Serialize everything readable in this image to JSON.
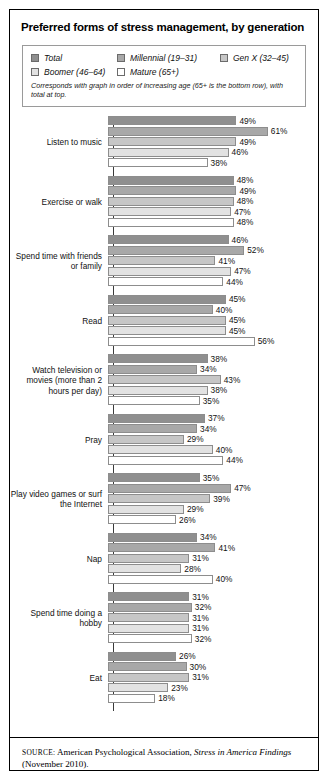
{
  "title": "Preferred forms of stress management, by generation",
  "legend": {
    "items": [
      {
        "label": "Total",
        "color": "#8f8f8f"
      },
      {
        "label": "Millennial (19–31)",
        "color": "#a8a8a8"
      },
      {
        "label": "Gen X (32–45)",
        "color": "#c6c6c6"
      },
      {
        "label": "Boomer (46–64)",
        "color": "#e2e2e2"
      },
      {
        "label": "Mature (65+)",
        "color": "#ffffff"
      }
    ],
    "note": "Corresponds with graph in order of increasing age (65+ is the bottom row), with total at top."
  },
  "source": {
    "label": "SOURCE:",
    "text_before": " American Psychological Association, ",
    "italic": "Stress in America Findings",
    "text_after": " (November 2010)."
  },
  "chart_data": {
    "type": "bar",
    "orientation": "horizontal",
    "title": "Preferred forms of stress management, by generation",
    "xlabel": "",
    "ylabel": "",
    "xlim": [
      0,
      61
    ],
    "grid": false,
    "value_suffix": "%",
    "legend_position": "top",
    "categories": [
      "Listen to music",
      "Exercise or walk",
      "Spend time with friends or family",
      "Read",
      "Watch television or movies (more than 2 hours per day)",
      "Pray",
      "Play video games or surf the Internet",
      "Nap",
      "Spend time doing a hobby",
      "Eat"
    ],
    "series": [
      {
        "name": "Total",
        "color": "#8f8f8f",
        "values": [
          49,
          48,
          46,
          45,
          38,
          37,
          35,
          34,
          31,
          26
        ]
      },
      {
        "name": "Millennial (19–31)",
        "color": "#a8a8a8",
        "values": [
          61,
          49,
          52,
          40,
          34,
          34,
          47,
          41,
          32,
          30
        ]
      },
      {
        "name": "Gen X (32–45)",
        "color": "#c6c6c6",
        "values": [
          49,
          48,
          41,
          45,
          43,
          29,
          39,
          31,
          31,
          31
        ]
      },
      {
        "name": "Boomer (46–64)",
        "color": "#e2e2e2",
        "values": [
          46,
          47,
          47,
          45,
          38,
          40,
          29,
          28,
          31,
          23
        ]
      },
      {
        "name": "Mature (65+)",
        "color": "#ffffff",
        "values": [
          38,
          48,
          44,
          56,
          35,
          44,
          26,
          40,
          32,
          18
        ]
      }
    ]
  }
}
